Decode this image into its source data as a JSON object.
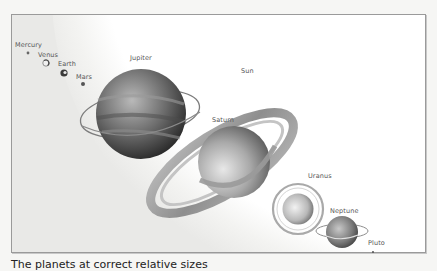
{
  "diagram": {
    "title_visible": false,
    "sun_label": "Sun",
    "planets": [
      {
        "name": "Mercury",
        "label": "Mercury"
      },
      {
        "name": "Venus",
        "label": "Venus"
      },
      {
        "name": "Earth",
        "label": "Earth"
      },
      {
        "name": "Mars",
        "label": "Mars"
      },
      {
        "name": "Jupiter",
        "label": "Jupiter"
      },
      {
        "name": "Saturn",
        "label": "Saturn"
      },
      {
        "name": "Uranus",
        "label": "Uranus"
      },
      {
        "name": "Neptune",
        "label": "Neptune"
      },
      {
        "name": "Pluto",
        "label": "Pluto"
      }
    ],
    "colors": {
      "frame_border": "#9a9a9a",
      "background_shadow": "#e9e9e7",
      "sun": "#ffffff",
      "label_text": "#555555"
    }
  },
  "caption": "The planets at correct relative sizes"
}
